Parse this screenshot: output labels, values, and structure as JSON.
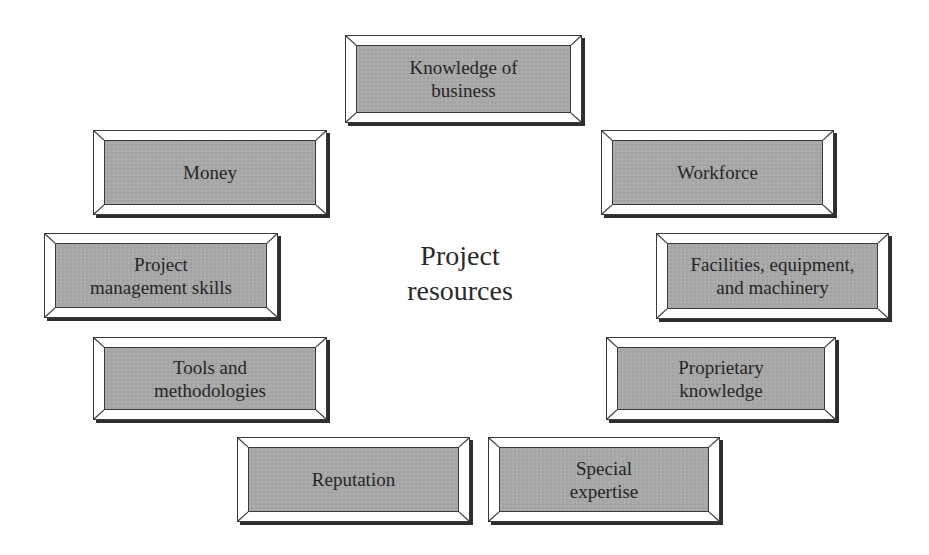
{
  "diagram": {
    "center": {
      "label": "Project\nresources"
    },
    "colors": {
      "box_face": "#a9a9a9",
      "box_bevel": "#ffffff",
      "box_border": "#3a3a3a",
      "box_shadow": "#2e2e2e",
      "text": "#262626",
      "background": "#ffffff"
    },
    "boxes": [
      {
        "id": "knowledge-of-business",
        "label": "Knowledge of\nbusiness",
        "x": 345,
        "y": 35,
        "w": 237,
        "h": 88
      },
      {
        "id": "money",
        "label": "Money",
        "x": 93,
        "y": 130,
        "w": 234,
        "h": 85
      },
      {
        "id": "workforce",
        "label": "Workforce",
        "x": 601,
        "y": 130,
        "w": 233,
        "h": 85
      },
      {
        "id": "project-management-skills",
        "label": "Project\nmanagement skills",
        "x": 44,
        "y": 233,
        "w": 234,
        "h": 85
      },
      {
        "id": "facilities-equipment-machinery",
        "label": "Facilities, equipment,\nand machinery",
        "x": 656,
        "y": 233,
        "w": 233,
        "h": 86
      },
      {
        "id": "tools-and-methodologies",
        "label": "Tools and\nmethodologies",
        "x": 93,
        "y": 337,
        "w": 234,
        "h": 83
      },
      {
        "id": "proprietary-knowledge",
        "label": "Proprietary\nknowledge",
        "x": 606,
        "y": 337,
        "w": 230,
        "h": 83
      },
      {
        "id": "reputation",
        "label": "Reputation",
        "x": 237,
        "y": 437,
        "w": 233,
        "h": 85
      },
      {
        "id": "special-expertise",
        "label": "Special\nexpertise",
        "x": 488,
        "y": 437,
        "w": 232,
        "h": 85
      }
    ]
  }
}
